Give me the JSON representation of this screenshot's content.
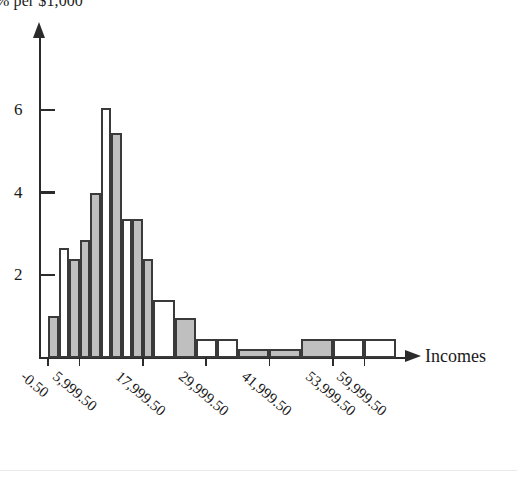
{
  "chart_data": {
    "type": "bar",
    "title": "",
    "ylabel": "% per $1,000",
    "xlabel": "Incomes",
    "grid": false,
    "legend": "none",
    "ylim": [
      0,
      6.6
    ],
    "yticks": [
      2,
      4,
      6
    ],
    "ytick_labels": [
      "2",
      "4",
      "6"
    ],
    "xlim": [
      -0.5,
      65999.5
    ],
    "xtick_values": [
      -0.5,
      5999.5,
      17999.5,
      29999.5,
      41999.5,
      53999.5,
      59999.5
    ],
    "xtick_labels": [
      "-0.50",
      "5,999.50",
      "17,999.50",
      "29,999.50",
      "41,999.50",
      "53,999.50",
      "59,999.50"
    ],
    "bin_edges": [
      -0.5,
      1999.5,
      3999.5,
      5999.5,
      7999.5,
      9999.5,
      11999.5,
      13999.5,
      15999.5,
      17999.5,
      19999.5,
      23999.5,
      27999.5,
      31999.5,
      35999.5,
      41999.5,
      47999.5,
      53999.5,
      59999.5,
      65999.5
    ],
    "categories": [
      "-0.50 to 1,999.50",
      "1,999.50 to 3,999.50",
      "3,999.50 to 5,999.50",
      "5,999.50 to 7,999.50",
      "7,999.50 to 9,999.50",
      "9,999.50 to 11,999.50",
      "11,999.50 to 13,999.50",
      "13,999.50 to 15,999.50",
      "15,999.50 to 17,999.50",
      "17,999.50 to 19,999.50",
      "19,999.50 to 23,999.50",
      "23,999.50 to 27,999.50",
      "27,999.50 to 31,999.50",
      "31,999.50 to 35,999.50",
      "35,999.50 to 41,999.50",
      "41,999.50 to 47,999.50",
      "47,999.50 to 53,999.50",
      "53,999.50 to 59,999.50",
      "59,999.50 to 65,999.50"
    ],
    "values": [
      1.0,
      2.65,
      2.4,
      2.85,
      4.0,
      6.05,
      5.45,
      3.35,
      3.35,
      2.4,
      1.4,
      0.95,
      0.45,
      0.45,
      0.2,
      0.2,
      0.45,
      0.45,
      0.45
    ],
    "bar_fills": [
      "gray",
      "white",
      "gray",
      "gray",
      "gray",
      "white",
      "gray",
      "white",
      "gray",
      "gray",
      "white",
      "gray",
      "white",
      "white",
      "gray",
      "gray",
      "gray",
      "white",
      "white"
    ]
  },
  "axis": {
    "y_label_text": "% per $1,000",
    "x_label_text": "Incomes"
  }
}
